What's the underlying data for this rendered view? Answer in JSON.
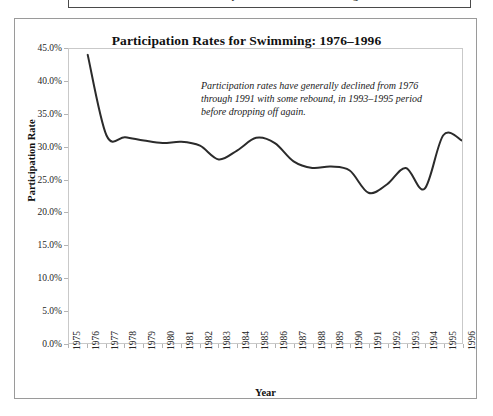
{
  "page": {
    "top_caption": "Exhibit 4.13 Line Chart of Participation Rates for Swimming"
  },
  "figure": {
    "title": "Participation Rates for Swimming: 1976–1996",
    "annotation_lines": [
      "Participation rates have generally declined from 1976",
      "through 1991 with some rebound, in 1993–1995 period",
      "before dropping off again."
    ]
  },
  "chart_data": {
    "type": "line",
    "title": "Participation Rates for Swimming: 1976–1996",
    "xlabel": "Year",
    "ylabel": "Participation Rate",
    "xlim": [
      1975,
      1996
    ],
    "ylim": [
      0,
      45
    ],
    "ytick_values": [
      0,
      5,
      10,
      15,
      20,
      25,
      30,
      35,
      40,
      45
    ],
    "ytick_labels": [
      "0.0%",
      "5.0%",
      "10.0%",
      "15.0%",
      "20.0%",
      "25.0%",
      "30.0%",
      "35.0%",
      "40.0%",
      "45.0%"
    ],
    "xtick_values": [
      1975,
      1976,
      1977,
      1978,
      1979,
      1980,
      1981,
      1982,
      1983,
      1984,
      1985,
      1986,
      1987,
      1988,
      1989,
      1990,
      1991,
      1992,
      1993,
      1994,
      1995,
      1996
    ],
    "xtick_labels": [
      "1975",
      "1976",
      "1977",
      "1978",
      "1979",
      "1980",
      "1981",
      "1982",
      "1983",
      "1984",
      "1985",
      "1986",
      "1987",
      "1988",
      "1989",
      "1990",
      "1991",
      "1992",
      "1993",
      "1994",
      "1995",
      "1996"
    ],
    "grid": false,
    "legend": "none",
    "smoothing": "spline",
    "line_color": "#2b2b2b",
    "line_width": 2.0,
    "x": [
      1976,
      1977,
      1978,
      1979,
      1980,
      1981,
      1982,
      1983,
      1984,
      1985,
      1986,
      1987,
      1988,
      1989,
      1990,
      1991,
      1992,
      1993,
      1994,
      1995,
      1996
    ],
    "values": [
      44.1,
      31.8,
      31.5,
      31.0,
      30.6,
      30.8,
      30.2,
      28.1,
      29.5,
      31.4,
      30.6,
      27.8,
      26.8,
      27.0,
      26.4,
      23.0,
      24.3,
      26.8,
      23.6,
      31.8,
      31.0
    ],
    "series": [
      {
        "name": "Swimming participation rate",
        "values": [
          44.1,
          31.8,
          31.5,
          31.0,
          30.6,
          30.8,
          30.2,
          28.1,
          29.5,
          31.4,
          30.6,
          27.8,
          26.8,
          27.0,
          26.4,
          23.0,
          24.3,
          26.8,
          23.6,
          31.8,
          31.0
        ]
      }
    ],
    "annotation": "Participation rates have generally declined from 1976 through 1991 with some rebound, in 1993–1995 period before dropping off again."
  }
}
